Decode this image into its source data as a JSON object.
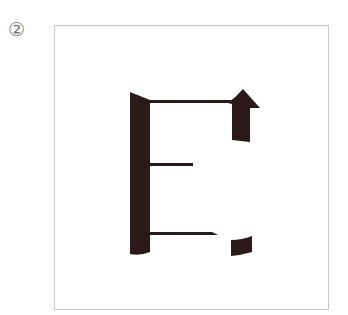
{
  "figure": {
    "label": "②",
    "ink_color": "#2a1a1a",
    "frame_color": "#c8c8c8",
    "glyph": "E",
    "parts": [
      {
        "name": "left-vertical-stroke"
      },
      {
        "name": "top-horizontal-stroke"
      },
      {
        "name": "arrow-head-top-right"
      },
      {
        "name": "middle-horizontal-stroke"
      },
      {
        "name": "bottom-horizontal-stroke"
      },
      {
        "name": "bottom-right-block"
      }
    ]
  }
}
